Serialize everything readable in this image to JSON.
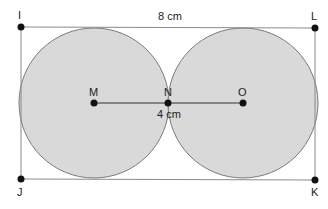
{
  "diagram": {
    "top_length_label": "8 cm",
    "segment_label": "4 cm",
    "fill_color": "#d9d9d9",
    "stroke_color": "#6e6e6e",
    "points": {
      "I": "I",
      "L": "L",
      "J": "J",
      "K": "K",
      "M": "M",
      "N": "N",
      "O": "O"
    }
  }
}
